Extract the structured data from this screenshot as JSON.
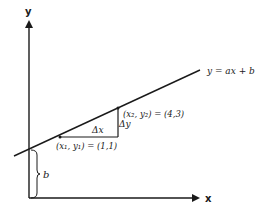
{
  "diagram": {
    "type": "slope-intercept line diagram",
    "axes": {
      "x_label": "x",
      "y_label": "y"
    },
    "line": {
      "equation_label": "y = ax + b"
    },
    "points": [
      {
        "name": "point-1",
        "label": "(x₁, y₁) = (1,1)"
      },
      {
        "name": "point-2",
        "label": "(x₂, y₂) = (4,3)"
      }
    ],
    "delta_x_label": "Δx",
    "delta_y_label": "Δy",
    "intercept_label": "b",
    "colors": {
      "stroke": "#1a1a1a",
      "background": "#ffffff"
    }
  }
}
